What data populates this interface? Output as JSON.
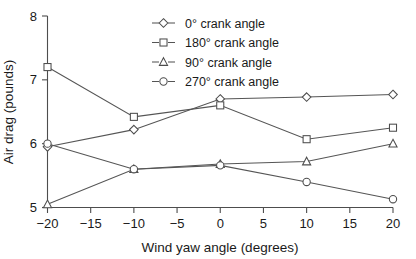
{
  "chart_data": {
    "type": "line",
    "title": "",
    "xlabel": "Wind yaw angle (degrees)",
    "ylabel": "Air drag (pounds)",
    "x": [
      -20,
      -10,
      0,
      10,
      20
    ],
    "xlim": [
      -20,
      20
    ],
    "ylim": [
      5,
      8
    ],
    "xticks": [
      -20,
      -15,
      -10,
      -5,
      0,
      5,
      10,
      15,
      20
    ],
    "xticklabels": [
      "−20",
      "−15",
      "−10",
      "−5",
      "0",
      "5",
      "10",
      "15",
      "20"
    ],
    "yticks": [
      5,
      6,
      7,
      8
    ],
    "yticklabels": [
      "5",
      "6",
      "7",
      "8"
    ],
    "grid": false,
    "legend_position": "top-center",
    "series": [
      {
        "name": "0° crank angle",
        "marker": "diamond",
        "values": [
          5.95,
          6.22,
          6.7,
          6.73,
          6.77
        ]
      },
      {
        "name": "180° crank angle",
        "marker": "square",
        "values": [
          7.2,
          6.42,
          6.6,
          6.07,
          6.25
        ]
      },
      {
        "name": "90° crank angle",
        "marker": "triangle",
        "values": [
          5.05,
          5.6,
          5.68,
          5.72,
          6.0
        ]
      },
      {
        "name": "270° crank angle",
        "marker": "circle",
        "values": [
          6.0,
          5.6,
          5.66,
          5.4,
          5.13
        ]
      }
    ]
  },
  "colors": {
    "line": "#555555",
    "axis": "#4d4d4d",
    "text": "#1a1a1a",
    "marker_fill": "#ffffff",
    "background": "#ffffff"
  }
}
